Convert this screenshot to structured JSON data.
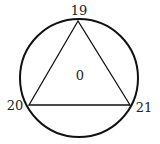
{
  "diagram": {
    "type": "inscribed-triangle-in-circle",
    "circle": {
      "cx": 79,
      "cy": 78,
      "r": 59,
      "stroke": "#111111"
    },
    "triangle": {
      "vertices": [
        {
          "name": "top",
          "x": 78,
          "y": 21,
          "label": "19"
        },
        {
          "name": "left",
          "x": 29,
          "y": 105,
          "label": "20"
        },
        {
          "name": "right",
          "x": 130,
          "y": 105,
          "label": "21"
        }
      ],
      "stroke": "#111111"
    },
    "center_label": "0"
  }
}
